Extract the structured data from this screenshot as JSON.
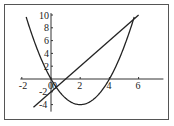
{
  "chart_data": {
    "type": "line",
    "title": "",
    "xlabel": "",
    "ylabel": "",
    "xlim": [
      -2,
      7.5
    ],
    "ylim": [
      -5,
      10.5
    ],
    "x_ticks": [
      -2,
      0,
      2,
      4,
      6
    ],
    "x_tick_labels": [
      "-2",
      "0",
      "2",
      "4",
      "6"
    ],
    "y_ticks": [
      -4,
      -2,
      2,
      4,
      6,
      8,
      10
    ],
    "y_tick_labels": [
      "-4",
      "-2",
      "2",
      "4",
      "6",
      "8",
      "10"
    ],
    "grid": false,
    "legend": null,
    "series": [
      {
        "name": "parabola y = x^2 - 4x",
        "x": [
          -1.7,
          -1,
          0,
          1,
          2,
          3,
          4,
          5,
          5.7
        ],
        "y": [
          9.69,
          5,
          0,
          -3,
          -4,
          -3,
          0,
          5,
          9.69
        ]
      },
      {
        "name": "line y = 2x - 2",
        "x": [
          -1.2,
          6
        ],
        "y": [
          -4.4,
          10
        ]
      }
    ],
    "intersections": [
      [
        0.35,
        -1.3
      ],
      [
        5.65,
        9.3
      ]
    ]
  }
}
